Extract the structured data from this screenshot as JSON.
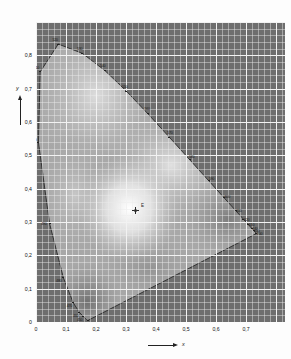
{
  "figure": {
    "kind": "cie-1931-chromaticity-diagram",
    "background_color": "#fdfdfd",
    "plot_fill_color": "#6e6e6e",
    "grid_color": "#f2f2f2"
  },
  "axes": {
    "x": {
      "name": "x",
      "ticks": [
        "0",
        "0,1",
        "0,2",
        "0,3",
        "0,4",
        "0,5",
        "0,6",
        "0,7"
      ],
      "tick_values": [
        0,
        0.1,
        0.2,
        0.3,
        0.4,
        0.5,
        0.6,
        0.7
      ],
      "range": [
        0,
        0.83
      ]
    },
    "y": {
      "name": "y",
      "ticks": [
        "0",
        "0,1",
        "0,2",
        "0,3",
        "0,4",
        "0,5",
        "0,6",
        "0,7",
        "0,8"
      ],
      "tick_values": [
        0,
        0.1,
        0.2,
        0.3,
        0.4,
        0.5,
        0.6,
        0.7,
        0.8
      ],
      "range": [
        0,
        0.9
      ]
    }
  },
  "white_point": {
    "label": "E",
    "x": 0.3333,
    "y": 0.3333
  },
  "wavelength_labels": [
    {
      "text": "520",
      "x": 0.0743,
      "y": 0.8338
    },
    {
      "text": "530",
      "x": 0.1547,
      "y": 0.8059
    },
    {
      "text": "540",
      "x": 0.2296,
      "y": 0.7543
    },
    {
      "text": "550",
      "x": 0.3016,
      "y": 0.6923
    },
    {
      "text": "560",
      "x": 0.3731,
      "y": 0.6245
    },
    {
      "text": "570",
      "x": 0.4441,
      "y": 0.5547
    },
    {
      "text": "580",
      "x": 0.5125,
      "y": 0.4866
    },
    {
      "text": "590",
      "x": 0.5752,
      "y": 0.4242
    },
    {
      "text": "600",
      "x": 0.627,
      "y": 0.3725
    },
    {
      "text": "610",
      "x": 0.6658,
      "y": 0.334
    },
    {
      "text": "620",
      "x": 0.6915,
      "y": 0.3083
    },
    {
      "text": "630",
      "x": 0.7079,
      "y": 0.292
    },
    {
      "text": "640",
      "x": 0.719,
      "y": 0.2809
    },
    {
      "text": "650",
      "x": 0.726,
      "y": 0.274
    },
    {
      "text": "700",
      "x": 0.7347,
      "y": 0.2653
    },
    {
      "text": "510",
      "x": 0.0139,
      "y": 0.7502
    },
    {
      "text": "500",
      "x": 0.0082,
      "y": 0.5384
    },
    {
      "text": "490",
      "x": 0.0454,
      "y": 0.295
    },
    {
      "text": "480",
      "x": 0.0913,
      "y": 0.1327
    },
    {
      "text": "470",
      "x": 0.1241,
      "y": 0.0578
    },
    {
      "text": "460",
      "x": 0.144,
      "y": 0.0297
    },
    {
      "text": "450",
      "x": 0.1566,
      "y": 0.0177
    },
    {
      "text": "400",
      "x": 0.1733,
      "y": 0.0048
    }
  ],
  "chart_data": {
    "type": "scatter",
    "title": "",
    "xlabel": "x",
    "ylabel": "y",
    "xlim": [
      0,
      0.83
    ],
    "ylim": [
      0,
      0.9
    ],
    "grid": true,
    "legend": "none",
    "annotations": [
      {
        "label": "E",
        "x": 0.3333,
        "y": 0.3333,
        "note": "equal-energy white point"
      }
    ],
    "spectral_locus": [
      {
        "nm": 400,
        "x": 0.1733,
        "y": 0.0048
      },
      {
        "nm": 410,
        "x": 0.1726,
        "y": 0.0048
      },
      {
        "nm": 420,
        "x": 0.1714,
        "y": 0.0051
      },
      {
        "nm": 430,
        "x": 0.1689,
        "y": 0.0069
      },
      {
        "nm": 440,
        "x": 0.1644,
        "y": 0.0109
      },
      {
        "nm": 450,
        "x": 0.1566,
        "y": 0.0177
      },
      {
        "nm": 460,
        "x": 0.144,
        "y": 0.0297
      },
      {
        "nm": 470,
        "x": 0.1241,
        "y": 0.0578
      },
      {
        "nm": 480,
        "x": 0.0913,
        "y": 0.1327
      },
      {
        "nm": 490,
        "x": 0.0454,
        "y": 0.295
      },
      {
        "nm": 500,
        "x": 0.0082,
        "y": 0.5384
      },
      {
        "nm": 510,
        "x": 0.0139,
        "y": 0.7502
      },
      {
        "nm": 520,
        "x": 0.0743,
        "y": 0.8338
      },
      {
        "nm": 530,
        "x": 0.1547,
        "y": 0.8059
      },
      {
        "nm": 540,
        "x": 0.2296,
        "y": 0.7543
      },
      {
        "nm": 550,
        "x": 0.3016,
        "y": 0.6923
      },
      {
        "nm": 560,
        "x": 0.3731,
        "y": 0.6245
      },
      {
        "nm": 570,
        "x": 0.4441,
        "y": 0.5547
      },
      {
        "nm": 580,
        "x": 0.5125,
        "y": 0.4866
      },
      {
        "nm": 590,
        "x": 0.5752,
        "y": 0.4242
      },
      {
        "nm": 600,
        "x": 0.627,
        "y": 0.3725
      },
      {
        "nm": 610,
        "x": 0.6658,
        "y": 0.334
      },
      {
        "nm": 620,
        "x": 0.6915,
        "y": 0.3083
      },
      {
        "nm": 630,
        "x": 0.7079,
        "y": 0.292
      },
      {
        "nm": 640,
        "x": 0.719,
        "y": 0.2809
      },
      {
        "nm": 650,
        "x": 0.726,
        "y": 0.274
      },
      {
        "nm": 660,
        "x": 0.73,
        "y": 0.27
      },
      {
        "nm": 670,
        "x": 0.732,
        "y": 0.268
      },
      {
        "nm": 680,
        "x": 0.7334,
        "y": 0.2666
      },
      {
        "nm": 700,
        "x": 0.7347,
        "y": 0.2653
      }
    ]
  }
}
